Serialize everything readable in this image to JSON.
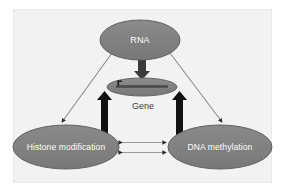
{
  "figure": {
    "type": "diagram",
    "background_color": "#ffffff",
    "panel_color": "#f2f2f2",
    "node_fill_color": "#7f7f7f",
    "node_stroke_color": "#5f5f5f",
    "node_text_color": "#ffffff",
    "gene_label_color": "#404040",
    "thin_arrow_color": "#8c8c8c",
    "thick_arrow_color": "#111111"
  },
  "nodes": [
    {
      "id": "rna",
      "label": "RNA",
      "shape": "ellipse",
      "cx": 140,
      "cy": 40,
      "rx": 40,
      "ry": 20
    },
    {
      "id": "gene",
      "label": "Gene",
      "shape": "ellipse",
      "cx": 142,
      "cy": 87,
      "rx": 35,
      "ry": 9,
      "label_position": "below"
    },
    {
      "id": "histone",
      "label": "Histone modification",
      "shape": "ellipse",
      "cx": 66,
      "cy": 147,
      "rx": 53,
      "ry": 22
    },
    {
      "id": "dnameth",
      "label": "DNA methylation",
      "shape": "ellipse",
      "cx": 220,
      "cy": 147,
      "rx": 52,
      "ry": 22
    }
  ],
  "edges": [
    {
      "id": "rna-to-gene",
      "from": "rna",
      "to": "gene",
      "style": "thick-block-arrow",
      "direction": "down",
      "color": "#3b3b3b"
    },
    {
      "id": "rna-to-histone",
      "from": "rna",
      "to": "histone",
      "style": "thin-line-arrow",
      "direction": "down-left",
      "color": "#8c8c8c"
    },
    {
      "id": "rna-to-dnameth",
      "from": "rna",
      "to": "dnameth",
      "style": "thin-line-arrow",
      "direction": "down-right",
      "color": "#8c8c8c"
    },
    {
      "id": "histone-to-gene",
      "from": "histone",
      "to": "gene",
      "style": "thick-block-arrow",
      "direction": "up",
      "color": "#111111"
    },
    {
      "id": "dnameth-to-gene",
      "from": "dnameth",
      "to": "gene",
      "style": "thick-block-arrow",
      "direction": "up",
      "color": "#111111"
    },
    {
      "id": "histone-dnameth-upper",
      "from": "histone",
      "to": "dnameth",
      "style": "thin-line-arrow",
      "direction": "bidirectional",
      "color": "#9a9a9a"
    },
    {
      "id": "histone-dnameth-lower",
      "from": "dnameth",
      "to": "histone",
      "style": "thin-line-arrow",
      "direction": "bidirectional",
      "color": "#9a9a9a"
    }
  ],
  "gene_glyph": {
    "description": "DNA strand bar with transcription start tick inside the Gene ellipse",
    "bar_color": "#4a4a4a",
    "tick_color": "#1a1a1a"
  }
}
